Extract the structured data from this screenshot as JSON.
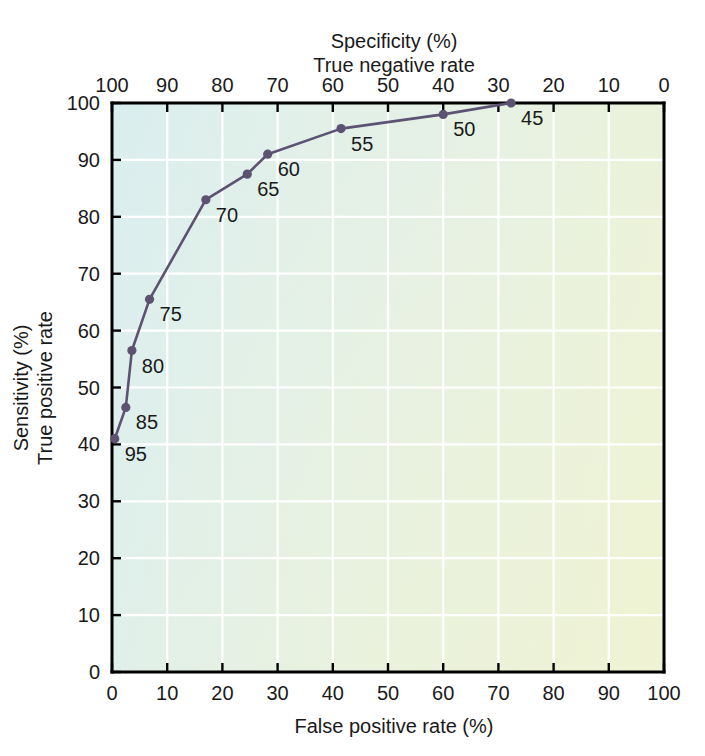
{
  "chart_data": {
    "type": "line",
    "title": "",
    "xlabel": "False positive rate (%)",
    "ylabel": "Sensitivity (%)",
    "ylabel2": "True positive rate",
    "top_axis_label": "Specificity (%)",
    "top_axis_label2": "True negative rate",
    "xlim": [
      0,
      100
    ],
    "ylim": [
      0,
      100
    ],
    "x_ticks": [
      0,
      10,
      20,
      30,
      40,
      50,
      60,
      70,
      80,
      90,
      100
    ],
    "y_ticks": [
      0,
      10,
      20,
      30,
      40,
      50,
      60,
      70,
      80,
      90,
      100
    ],
    "top_ticks": [
      100,
      90,
      80,
      70,
      60,
      50,
      40,
      30,
      20,
      10,
      0
    ],
    "top_axis_reversed": true,
    "grid": true,
    "legend": "none",
    "series": [
      {
        "name": "ROC curve",
        "color": "#5d5272",
        "marker": "circle",
        "points": [
          {
            "label": "95",
            "x": 0.5,
            "y": 41.0
          },
          {
            "label": "85",
            "x": 2.5,
            "y": 46.5
          },
          {
            "label": "80",
            "x": 3.6,
            "y": 56.5
          },
          {
            "label": "75",
            "x": 6.8,
            "y": 65.5
          },
          {
            "label": "70",
            "x": 17.0,
            "y": 83.0
          },
          {
            "label": "65",
            "x": 24.5,
            "y": 87.5
          },
          {
            "label": "60",
            "x": 28.2,
            "y": 91.0
          },
          {
            "label": "55",
            "x": 41.5,
            "y": 95.5
          },
          {
            "label": "50",
            "x": 60.0,
            "y": 98.0
          },
          {
            "label": "45",
            "x": 72.3,
            "y": 100.0
          }
        ]
      }
    ],
    "colors": {
      "curve": "#5d5272",
      "marker": "#5d5272",
      "grid": "#ffffff",
      "axis": "#000000",
      "plot_bg_top_left": "#dceeee",
      "plot_bg_top_right": "#e6f2e4",
      "plot_bg_bottom_left": "#e9f1dd",
      "plot_bg_bottom_right": "#eef3d4"
    }
  }
}
